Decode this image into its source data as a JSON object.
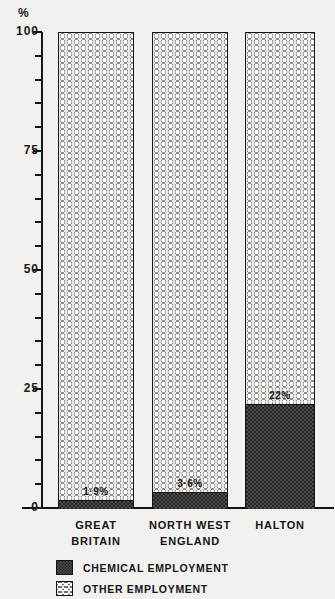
{
  "chart_data": {
    "type": "bar",
    "subtype": "stacked-100-percent",
    "title": "",
    "xlabel": "",
    "ylabel": "%",
    "ylim": [
      0,
      100
    ],
    "grid": false,
    "categories": [
      "GREAT BRITAIN",
      "NORTH WEST ENGLAND",
      "HALTON"
    ],
    "category_lines": [
      [
        "GREAT",
        "BRITAIN"
      ],
      [
        "NORTH WEST",
        "ENGLAND"
      ],
      [
        "HALTON"
      ]
    ],
    "y_tick_labels": [
      "0",
      "25",
      "50",
      "75",
      "100"
    ],
    "y_tick_values": [
      0,
      25,
      50,
      75,
      100
    ],
    "y_minor_step": 5,
    "series": [
      {
        "name": "CHEMICAL EMPLOYMENT",
        "values": [
          1.9,
          3.6,
          22
        ],
        "value_labels": [
          "1·9%",
          "3·6%",
          "22%"
        ],
        "pattern": "dark-checkerboard",
        "color": "#3b3a38"
      },
      {
        "name": "OTHER EMPLOYMENT",
        "values": [
          98.1,
          96.4,
          78
        ],
        "value_labels": [
          "",
          "",
          ""
        ],
        "pattern": "light-circles",
        "color": "#f1f0ed"
      }
    ],
    "legend": {
      "position": "bottom-left",
      "entries": [
        {
          "label": "CHEMICAL EMPLOYMENT",
          "pattern": "dark-checkerboard"
        },
        {
          "label": "OTHER EMPLOYMENT",
          "pattern": "light-circles"
        }
      ]
    },
    "annotations": []
  },
  "axis": {
    "unit_label": "%"
  }
}
